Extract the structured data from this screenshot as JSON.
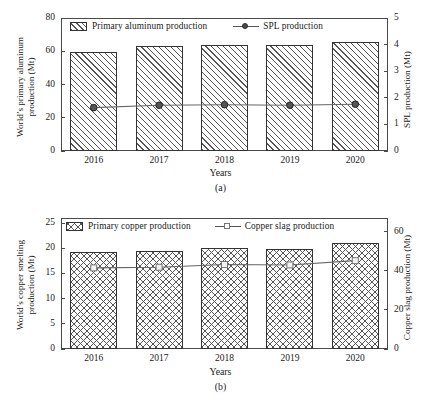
{
  "figure": {
    "panels": [
      "a",
      "b"
    ]
  },
  "panel_a": {
    "caption": "(a)",
    "xaxis_title": "Years",
    "left_axis_label": "World’s primary aluminum production (Mt)",
    "left_axis_label_line1": "World’s primary aluminum",
    "left_axis_label_line2": "production (Mt)",
    "right_axis_label": "SPL production (Mt)",
    "left_ticks": [
      "0",
      "20",
      "40",
      "60",
      "80"
    ],
    "right_ticks": [
      "0",
      "1",
      "2",
      "3",
      "4",
      "5"
    ],
    "legend": {
      "bar_label": "Primary aluminum production",
      "line_label": "SPL production"
    }
  },
  "panel_b": {
    "caption": "(b)",
    "xaxis_title": "Years",
    "left_axis_label": "World’s copper smelting production (Mt)",
    "left_axis_label_line1": "World’s copper smelting",
    "left_axis_label_line2": "production (Mt)",
    "right_axis_label": "Copper slag production (Mt)",
    "left_ticks": [
      "0",
      "5",
      "10",
      "15",
      "20",
      "25"
    ],
    "right_ticks": [
      "0",
      "20",
      "40",
      "60"
    ],
    "legend": {
      "bar_label": "Primary copper production",
      "line_label": "Copper slag production"
    }
  },
  "chart_data": [
    {
      "type": "bar",
      "panel": "a",
      "title": "",
      "xlabel": "Years",
      "ylabel": "World’s primary aluminum production (Mt)",
      "y2label": "SPL production (Mt)",
      "categories": [
        "2016",
        "2017",
        "2018",
        "2019",
        "2020"
      ],
      "ylim": [
        0,
        80
      ],
      "yticks": [
        0,
        20,
        40,
        60,
        80
      ],
      "y2lim": [
        0,
        5
      ],
      "y2ticks": [
        0,
        1,
        2,
        3,
        4,
        5
      ],
      "grid": false,
      "legend_position": "top-inside",
      "series": [
        {
          "name": "Primary aluminum production",
          "type": "bar",
          "axis": "left",
          "pattern": "diagonal-hatch",
          "values": [
            59.7,
            63.4,
            63.9,
            63.7,
            65.3
          ]
        },
        {
          "name": "SPL production",
          "type": "line",
          "axis": "right",
          "marker": "filled-circle",
          "values": [
            1.63,
            1.72,
            1.74,
            1.72,
            1.76
          ]
        }
      ]
    },
    {
      "type": "bar",
      "panel": "b",
      "title": "",
      "xlabel": "Years",
      "ylabel": "World’s copper smelting production (Mt)",
      "y2label": "Copper slag production (Mt)",
      "categories": [
        "2016",
        "2017",
        "2018",
        "2019",
        "2020"
      ],
      "ylim": [
        0,
        26
      ],
      "yticks": [
        0,
        5,
        10,
        15,
        20,
        25
      ],
      "y2lim": [
        0,
        67
      ],
      "y2ticks": [
        0,
        20,
        40,
        60
      ],
      "grid": false,
      "legend_position": "top-inside",
      "series": [
        {
          "name": "Primary copper production",
          "type": "bar",
          "axis": "left",
          "pattern": "cross-hatch",
          "values": [
            19.3,
            19.5,
            20.1,
            19.9,
            21.0
          ]
        },
        {
          "name": "Copper slag production",
          "type": "line",
          "axis": "right",
          "marker": "open-square",
          "values": [
            41.5,
            41.8,
            43.2,
            43.0,
            45.2
          ]
        }
      ]
    }
  ]
}
